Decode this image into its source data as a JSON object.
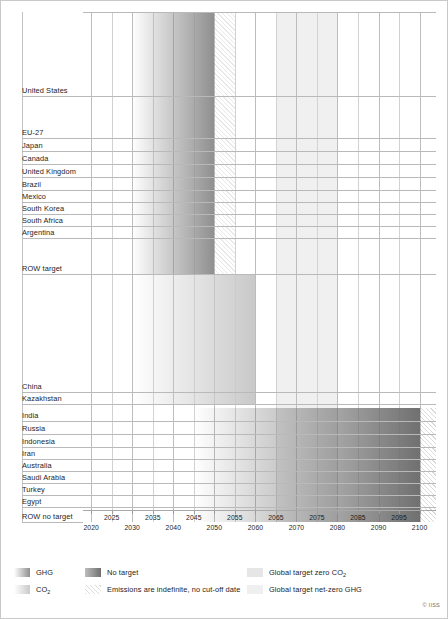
{
  "chart_data": {
    "type": "bar",
    "title": "",
    "subtitle": "",
    "xlabel": "",
    "ylabel": "",
    "xlim": [
      2018,
      2104
    ],
    "grid": true,
    "legend_position": "bottom",
    "axis": {
      "ticks": [
        2020,
        2025,
        2030,
        2035,
        2040,
        2045,
        2050,
        2055,
        2060,
        2065,
        2070,
        2075,
        2080,
        2085,
        2090,
        2095,
        2100
      ],
      "tick_labels": [
        "2020",
        "2025",
        "2030",
        "2035",
        "2040",
        "2045",
        "2050",
        "2055",
        "2060",
        "2065",
        "2070",
        "2075",
        "2080",
        "2085",
        "2090",
        "2095",
        "2100"
      ]
    },
    "categories": [
      "United States",
      "EU-27",
      "Japan",
      "Canada",
      "United Kingdom",
      "Brazil",
      "Mexico",
      "South Korea",
      "South Africa",
      "Argentina",
      "ROW target",
      "China",
      "Kazakhstan",
      "India",
      "Russia",
      "Indonesia",
      "Iran",
      "Australia",
      "Saudi Arabia",
      "Turkey",
      "Egypt",
      "ROW no target"
    ],
    "rows": [
      {
        "label": "United States",
        "group": "target",
        "start": 2030,
        "end": 2050,
        "fade_start": 2030,
        "indefinite_to": 2055,
        "target_type": "GHG"
      },
      {
        "label": "EU-27",
        "group": "target",
        "start": 2030,
        "end": 2050,
        "fade_start": 2030,
        "indefinite_to": 2055,
        "target_type": "GHG"
      },
      {
        "label": "Japan",
        "group": "target",
        "start": 2030,
        "end": 2050,
        "fade_start": 2030,
        "indefinite_to": 2055,
        "target_type": "GHG"
      },
      {
        "label": "Canada",
        "group": "target",
        "start": 2030,
        "end": 2050,
        "fade_start": 2030,
        "indefinite_to": 2055,
        "target_type": "GHG"
      },
      {
        "label": "United Kingdom",
        "group": "target",
        "start": 2030,
        "end": 2050,
        "fade_start": 2030,
        "indefinite_to": 2055,
        "target_type": "GHG"
      },
      {
        "label": "Brazil",
        "group": "target",
        "start": 2030,
        "end": 2050,
        "fade_start": 2030,
        "indefinite_to": 2055,
        "target_type": "GHG"
      },
      {
        "label": "Mexico",
        "group": "target",
        "start": 2030,
        "end": 2050,
        "fade_start": 2030,
        "indefinite_to": 2055,
        "target_type": "GHG"
      },
      {
        "label": "South Korea",
        "group": "target",
        "start": 2030,
        "end": 2050,
        "fade_start": 2030,
        "indefinite_to": 2055,
        "target_type": "GHG"
      },
      {
        "label": "South Africa",
        "group": "target",
        "start": 2030,
        "end": 2050,
        "fade_start": 2030,
        "indefinite_to": 2055,
        "target_type": "GHG"
      },
      {
        "label": "Argentina",
        "group": "target",
        "start": 2030,
        "end": 2050,
        "fade_start": 2030,
        "indefinite_to": 2055,
        "target_type": "GHG"
      },
      {
        "label": "ROW target",
        "group": "target",
        "start": 2030,
        "end": 2050,
        "fade_start": 2030,
        "indefinite_to": 2055,
        "target_type": "GHG"
      },
      {
        "label": "China",
        "group": "target",
        "start": 2030,
        "end": 2060,
        "fade_start": 2030,
        "indefinite_to": 2060,
        "target_type": "CO2"
      },
      {
        "label": "Kazakhstan",
        "group": "target",
        "start": 2030,
        "end": 2060,
        "fade_start": 2030,
        "indefinite_to": 2060,
        "target_type": "CO2"
      },
      {
        "label": "India",
        "group": "no-target",
        "start": 2045,
        "end": 2100,
        "fade_start": 2045,
        "indefinite_to": 2104,
        "target_type": "No target"
      },
      {
        "label": "Russia",
        "group": "no-target",
        "start": 2045,
        "end": 2100,
        "fade_start": 2045,
        "indefinite_to": 2104,
        "target_type": "No target"
      },
      {
        "label": "Indonesia",
        "group": "no-target",
        "start": 2045,
        "end": 2100,
        "fade_start": 2045,
        "indefinite_to": 2104,
        "target_type": "No target"
      },
      {
        "label": "Iran",
        "group": "no-target",
        "start": 2045,
        "end": 2100,
        "fade_start": 2045,
        "indefinite_to": 2104,
        "target_type": "No target"
      },
      {
        "label": "Australia",
        "group": "no-target",
        "start": 2045,
        "end": 2100,
        "fade_start": 2045,
        "indefinite_to": 2104,
        "target_type": "No target"
      },
      {
        "label": "Saudi Arabia",
        "group": "no-target",
        "start": 2045,
        "end": 2100,
        "fade_start": 2045,
        "indefinite_to": 2104,
        "target_type": "No target"
      },
      {
        "label": "Turkey",
        "group": "no-target",
        "start": 2045,
        "end": 2100,
        "fade_start": 2045,
        "indefinite_to": 2104,
        "target_type": "No target"
      },
      {
        "label": "Egypt",
        "group": "no-target",
        "start": 2045,
        "end": 2100,
        "fade_start": 2045,
        "indefinite_to": 2104,
        "target_type": "No target"
      },
      {
        "label": "ROW no target",
        "group": "no-target",
        "start": 2045,
        "end": 2100,
        "fade_start": 2045,
        "indefinite_to": 2104,
        "target_type": "No target"
      }
    ],
    "global_bands": [
      {
        "name": "Global target zero CO2",
        "start": 2065,
        "end": 2080,
        "color": "#ececec"
      },
      {
        "name": "Global target net-zero GHG",
        "start": 2065,
        "end": 2080,
        "color": "#f0f0f0"
      }
    ],
    "annotations": []
  },
  "legend": {
    "items": [
      {
        "id": "ghg",
        "label": "GHG",
        "swatch": "gradient-ghg",
        "col": 0,
        "row": 0
      },
      {
        "id": "co2",
        "label": "CO",
        "sub": "2",
        "swatch": "gradient-co2",
        "col": 0,
        "row": 1
      },
      {
        "id": "no-target",
        "label": "No target",
        "swatch": "gradient-notarget",
        "col": 1,
        "row": 0
      },
      {
        "id": "indefinite",
        "label": "Emissions are indefinite, no cut-off date",
        "swatch": "hatch",
        "col": 1,
        "row": 1
      },
      {
        "id": "global-co2",
        "label": "Global target zero CO",
        "sub": "2",
        "swatch": "flat-light",
        "col": 2,
        "row": 0
      },
      {
        "id": "global-ghg",
        "label": "Global target net-zero GHG",
        "swatch": "flat-lighter",
        "col": 2,
        "row": 1
      }
    ]
  },
  "credit": "© IISS",
  "colors": {
    "grid": "#d2d2d2",
    "rowline": "#b9b9b9",
    "axis": "#a8a8a8",
    "text": "#1d1d1d",
    "ghg_dark": "#8f8f8f",
    "co2_dark": "#c9c9c9",
    "notarget_dark": "#707070",
    "band": "#ececec"
  }
}
